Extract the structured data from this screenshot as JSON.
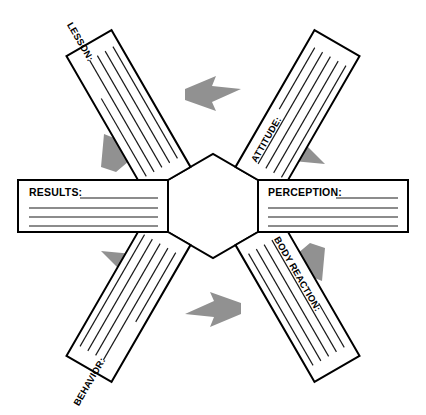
{
  "diagram": {
    "shape": "hexagon-cycle",
    "flow_direction": "clockwise",
    "center_shape": "hexagon",
    "center_text": "",
    "colors": {
      "arrow_gray": "#919191",
      "outline_black": "#000000",
      "card_fill": "#ffffff",
      "page_background": "#ffffff"
    },
    "nodes": [
      {
        "id": "results",
        "label": "RESULTS:",
        "orientation": "horizontal",
        "position": "left",
        "write_lines": 4,
        "value": ""
      },
      {
        "id": "lesson",
        "label": "LESSON:",
        "orientation": "rotated",
        "position": "upper-left",
        "write_lines": 5,
        "value": ""
      },
      {
        "id": "attitude",
        "label": "ATTITUDE:",
        "orientation": "rotated",
        "position": "upper-right",
        "write_lines": 5,
        "value": ""
      },
      {
        "id": "perception",
        "label": "PERCEPTION:",
        "orientation": "horizontal",
        "position": "right",
        "write_lines": 4,
        "value": ""
      },
      {
        "id": "body-reaction",
        "label": "BODY REACTION:",
        "orientation": "rotated",
        "position": "lower-right",
        "write_lines": 5,
        "value": ""
      },
      {
        "id": "behavior",
        "label": "BEHAVIOR:",
        "orientation": "rotated",
        "position": "lower-left",
        "write_lines": 5,
        "value": ""
      }
    ],
    "arrows": [
      {
        "id": "arrow-top",
        "from": "lesson",
        "to": "attitude",
        "direction": "right"
      },
      {
        "id": "arrow-upper-right",
        "from": "attitude",
        "to": "perception",
        "direction": "down-right"
      },
      {
        "id": "arrow-lower-right",
        "from": "perception",
        "to": "body-reaction",
        "direction": "down-left"
      },
      {
        "id": "arrow-bottom",
        "from": "body-reaction",
        "to": "behavior",
        "direction": "left"
      },
      {
        "id": "arrow-lower-left",
        "from": "behavior",
        "to": "results",
        "direction": "up-left"
      },
      {
        "id": "arrow-upper-left",
        "from": "results",
        "to": "lesson",
        "direction": "up-right"
      }
    ]
  }
}
